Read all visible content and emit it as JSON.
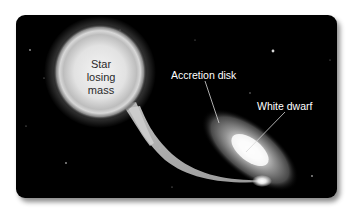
{
  "diagram": {
    "background_color": "#000000",
    "labels": {
      "star": [
        "Star",
        "losing",
        "mass"
      ],
      "accretion_disk": "Accretion disk",
      "white_dwarf": "White dwarf"
    },
    "components": [
      {
        "name": "donor-star",
        "description": "Large glowing star losing mass"
      },
      {
        "name": "mass-stream",
        "description": "Stream of gas flowing from star to disk"
      },
      {
        "name": "accretion-disk",
        "description": "Tilted elliptical disk around white dwarf"
      },
      {
        "name": "white-dwarf",
        "description": "Bright compact core in disk center"
      },
      {
        "name": "hot-spot",
        "description": "Bright impact point where stream hits disk"
      }
    ]
  }
}
